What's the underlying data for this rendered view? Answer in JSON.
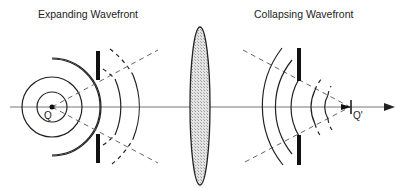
{
  "titles": {
    "left": "Expanding Wavefront",
    "right": "Collapsing Wavefront"
  },
  "labels": {
    "source_point": "Q",
    "image_point": "Q'"
  },
  "elements": {
    "optical_axis": "arrow pointing right",
    "lens": "converging lens (shaded ellipse)",
    "left_aperture": "aperture stop with two opaque bars",
    "right_aperture": "aperture stop with two opaque bars"
  },
  "colors": {
    "line": "#222222",
    "axis": "#777777",
    "lens_fill": "#d8d8d8",
    "dashed": "#666666"
  }
}
